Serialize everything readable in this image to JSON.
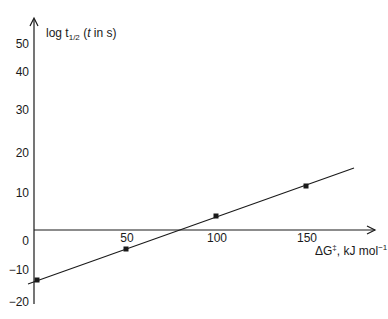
{
  "chart_data": {
    "type": "scatter",
    "title": "",
    "xlabel": "ΔG‡, kJ mol⁻¹",
    "ylabel": "log t1/2 (t in s)",
    "xlabel_parts": {
      "main": "ΔG",
      "sup1": "‡",
      "rest": ", kJ mol",
      "sup2": "−1"
    },
    "ylabel_parts": {
      "main": "log t",
      "sub": "1/2",
      "rest_open": " (",
      "italic": "t",
      "rest_close": " in s)"
    },
    "x_ticks": [
      {
        "value": 50,
        "label": "50",
        "px": 127
      },
      {
        "value": 100,
        "label": "100",
        "px": 217
      },
      {
        "value": 150,
        "label": "150",
        "px": 307
      }
    ],
    "y_ticks": [
      {
        "value": 50,
        "label": "50",
        "py": 48
      },
      {
        "value": 40,
        "label": "40",
        "py": 76
      },
      {
        "value": 30,
        "label": "30",
        "py": 114
      },
      {
        "value": 20,
        "label": "20",
        "py": 157
      },
      {
        "value": 10,
        "label": "10",
        "py": 197
      },
      {
        "value": 0,
        "label": "0",
        "py": 245
      },
      {
        "value": -10,
        "label": "−10",
        "py": 274
      },
      {
        "value": -20,
        "label": "−20",
        "py": 306
      }
    ],
    "xlim": [
      0,
      175
    ],
    "ylim": [
      -20,
      55
    ],
    "grid": false,
    "legend": null,
    "series": [
      {
        "name": "data points",
        "marker": "square",
        "points": [
          {
            "x": 0,
            "y": -13.5,
            "px": 37,
            "py": 280
          },
          {
            "x": 50,
            "y": -5,
            "px": 126,
            "py": 249
          },
          {
            "x": 100,
            "y": 4,
            "px": 216,
            "py": 216
          },
          {
            "x": 150,
            "y": 12,
            "px": 306,
            "py": 186
          }
        ]
      },
      {
        "name": "linear fit",
        "type": "line",
        "start": {
          "px": 28,
          "py": 284
        },
        "end": {
          "px": 354,
          "py": 168
        }
      }
    ],
    "colors": {
      "ink": "#1a1a1a",
      "background": "#ffffff"
    }
  }
}
